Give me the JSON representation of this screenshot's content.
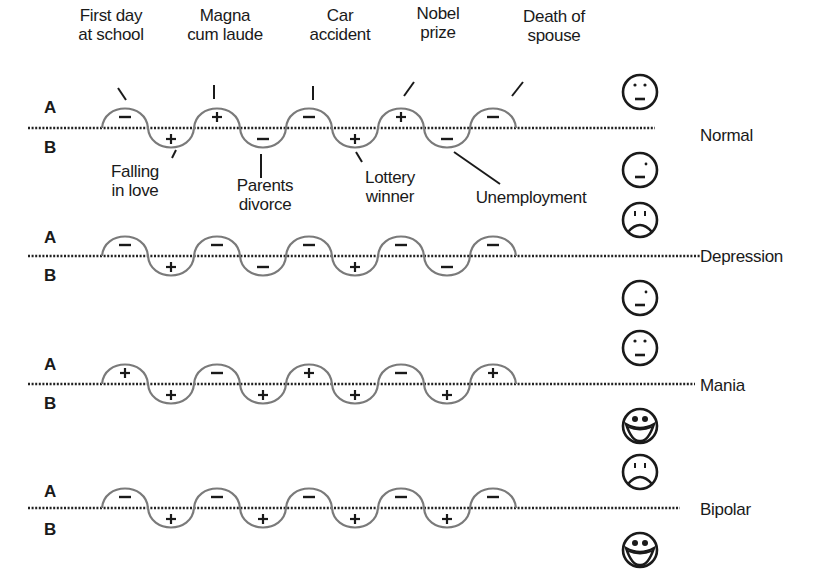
{
  "figure": {
    "axis_labels": {
      "above": "A",
      "below": "B"
    },
    "events": [
      {
        "label": "First day\nat school",
        "line1": "First day",
        "line2": "at school",
        "valence": "-",
        "position": "A"
      },
      {
        "label": "Falling\nin love",
        "line1": "Falling",
        "line2": "in love",
        "valence": "+",
        "position": "B"
      },
      {
        "label": "Magna\ncum laude",
        "line1": "Magna",
        "line2": "cum laude",
        "valence": "+",
        "position": "A"
      },
      {
        "label": "Parents\ndivorce",
        "line1": "Parents",
        "line2": "divorce",
        "valence": "-",
        "position": "B"
      },
      {
        "label": "Car\naccident",
        "line1": "Car",
        "line2": "accident",
        "valence": "-",
        "position": "A"
      },
      {
        "label": "Lottery\nwinner",
        "line1": "Lottery",
        "line2": "winner",
        "valence": "+",
        "position": "B"
      },
      {
        "label": "Nobel\nprize",
        "line1": "Nobel",
        "line2": "prize",
        "valence": "+",
        "position": "A"
      },
      {
        "label": "Unemployment",
        "line1": "Unemployment",
        "line2": "",
        "valence": "-",
        "position": "B"
      },
      {
        "label": "Death of\nspouse",
        "line1": "Death of",
        "line2": "spouse",
        "valence": "-",
        "position": "A"
      }
    ],
    "conditions": [
      {
        "name": "Normal",
        "signs": [
          "-",
          "+",
          "+",
          "-",
          "-",
          "+",
          "+",
          "-",
          "-"
        ],
        "face_above": "neutral",
        "face_below": "neutral-wink"
      },
      {
        "name": "Depression",
        "signs": [
          "-",
          "+",
          "-",
          "-",
          "-",
          "+",
          "-",
          "-",
          "-"
        ],
        "face_above": "sad",
        "face_below": "neutral-wink"
      },
      {
        "name": "Mania",
        "signs": [
          "+",
          "+",
          "-",
          "+",
          "+",
          "+",
          "-",
          "+",
          "+"
        ],
        "face_above": "neutral",
        "face_below": "big-smile"
      },
      {
        "name": "Bipolar",
        "signs": [
          "-",
          "+",
          "-",
          "+",
          "-",
          "+",
          "-",
          "+",
          "-"
        ],
        "face_above": "sad",
        "face_below": "big-smile"
      }
    ]
  },
  "style": {
    "wave_color": "#7a7a7a",
    "ink_color": "#1a1a1a",
    "background": "#ffffff"
  }
}
